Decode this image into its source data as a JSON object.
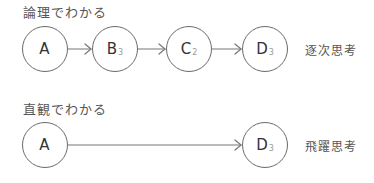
{
  "diagram": {
    "sequential": {
      "title": "論理でわかる",
      "caption": "逐次思考",
      "nodes": [
        {
          "label": "A",
          "sub": ""
        },
        {
          "label": "B",
          "sub": "3"
        },
        {
          "label": "C",
          "sub": "2"
        },
        {
          "label": "D",
          "sub": "3"
        }
      ]
    },
    "leap": {
      "title": "直観でわかる",
      "caption": "飛躍思考",
      "nodes": [
        {
          "label": "A",
          "sub": ""
        },
        {
          "label": "D",
          "sub": "3"
        }
      ]
    },
    "colors": {
      "stroke": "#6a6a6a",
      "text": "#333333",
      "subscript": "#999999"
    }
  }
}
